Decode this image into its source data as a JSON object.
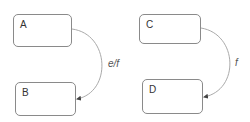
{
  "diagram": {
    "type": "state-chart",
    "states": [
      {
        "id": "A",
        "label": "A"
      },
      {
        "id": "B",
        "label": "B"
      },
      {
        "id": "C",
        "label": "C"
      },
      {
        "id": "D",
        "label": "D"
      }
    ],
    "transitions": [
      {
        "from": "A",
        "to": "B",
        "label": "e/f"
      },
      {
        "from": "C",
        "to": "D",
        "label": "f"
      }
    ],
    "colors": {
      "box_border": "#8a8a8a",
      "edge": "#aaaaaa",
      "text": "#333333"
    }
  }
}
